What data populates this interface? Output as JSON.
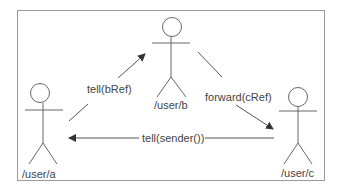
{
  "diagram": {
    "actors": [
      {
        "id": "a",
        "label": "/user/a"
      },
      {
        "id": "b",
        "label": "/user/b"
      },
      {
        "id": "c",
        "label": "/user/c"
      }
    ],
    "messages": [
      {
        "from": "a",
        "to": "b",
        "label": "tell(bRef)"
      },
      {
        "from": "b",
        "to": "c",
        "label": "forward(cRef)"
      },
      {
        "from": "c",
        "to": "a",
        "label": "tell(sender())"
      }
    ],
    "colors": {
      "stroke": "#555555",
      "border": "#9a9a9a",
      "text": "#444444"
    }
  }
}
